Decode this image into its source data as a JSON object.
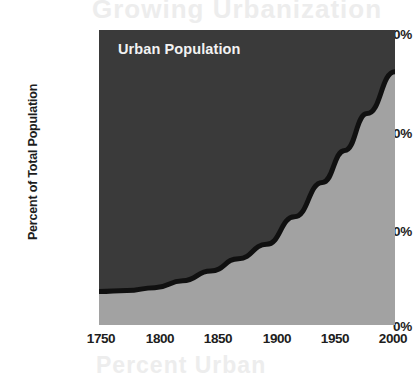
{
  "chart_data": {
    "type": "area",
    "title": "",
    "series_label": "Urban Population",
    "xlabel": "",
    "ylabel": "Percent of Total Population",
    "xlim": [
      1750,
      2015
    ],
    "ylim": [
      0,
      60
    ],
    "xticks": [
      "1750",
      "1800",
      "1850",
      "1900",
      "1950",
      "2000"
    ],
    "xtick_values": [
      1750,
      1800,
      1850,
      1900,
      1950,
      2000
    ],
    "yticks": [
      "0%",
      "20%",
      "40%",
      "60%"
    ],
    "ytick_values": [
      0,
      20,
      40,
      60
    ],
    "grid": false,
    "legend_position": "none",
    "x": [
      1750,
      1775,
      1800,
      1825,
      1850,
      1875,
      1900,
      1925,
      1950,
      1970,
      1990,
      2015
    ],
    "values": [
      6.8,
      7.0,
      7.6,
      9.0,
      11.0,
      13.5,
      16.4,
      22.0,
      29.0,
      35.5,
      43.0,
      51.5
    ],
    "series": [
      {
        "name": "Urban Population",
        "values": [
          6.8,
          7.0,
          7.6,
          9.0,
          11.0,
          13.5,
          16.4,
          22.0,
          29.0,
          35.5,
          43.0,
          51.5
        ]
      }
    ],
    "colors": {
      "area_above": "#3a3a3a",
      "area_below": "#a2a2a2",
      "curve": "#101010",
      "label_text": "#f2f2f2",
      "axis_text": "#1d1d1d",
      "background": "#ffffff"
    }
  },
  "ghost_artifacts": {
    "top": "Growing Urbanization",
    "bottom": "Percent Urban"
  }
}
